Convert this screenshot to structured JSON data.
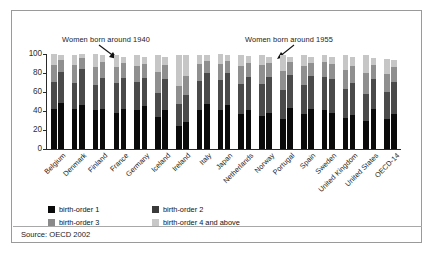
{
  "figure": {
    "source_note": "Source: OECD 2002",
    "annotations": [
      {
        "name": "cohort-1940",
        "text": "Women born around 1940"
      },
      {
        "name": "cohort-1955",
        "text": "Women born around 1955"
      }
    ]
  },
  "legend": {
    "position": "below-axis",
    "items": [
      {
        "key": "b1",
        "label": "birth-order 1",
        "color": "#0a0a0a"
      },
      {
        "key": "b2",
        "label": "birth-order 2",
        "color": "#3a3a3a"
      },
      {
        "key": "b3",
        "label": "birth-order 3",
        "color": "#8a8a8a"
      },
      {
        "key": "b4",
        "label": "birth-order 4 and above",
        "color": "#c8c8c8"
      }
    ]
  },
  "chart_data": {
    "type": "bar",
    "subtype": "stacked-grouped",
    "title": "",
    "xlabel": "",
    "ylabel": "",
    "ylim": [
      0,
      100
    ],
    "yticks": [
      0,
      20,
      40,
      60,
      80,
      100
    ],
    "ytick_labels": [
      "0",
      "20",
      "40",
      "60",
      "80",
      "100"
    ],
    "grid": false,
    "categories": [
      "Belgium",
      "Denmark",
      "Finland",
      "France",
      "Germany",
      "Iceland",
      "Ireland",
      "Italy",
      "Japan",
      "Netherlands",
      "Norway",
      "Portugal",
      "Spain",
      "Sweden",
      "United Kingdom",
      "United States",
      "OECD-14"
    ],
    "group_labels": [
      "Women born around 1940",
      "Women born around 1955"
    ],
    "stack_order": [
      "birth-order 1",
      "birth-order 2",
      "birth-order 3",
      "birth-order 4 and above"
    ],
    "series": [
      {
        "name": "birth-order 1",
        "cohort_1940": [
          42,
          42,
          41,
          38,
          41,
          34,
          24,
          41,
          41,
          37,
          35,
          32,
          37,
          41,
          33,
          29,
          32
        ],
        "cohort_1955": [
          48,
          46,
          42,
          42,
          45,
          41,
          28,
          47,
          46,
          41,
          38,
          43,
          42,
          38,
          36,
          42,
          37
        ]
      },
      {
        "name": "birth-order 2",
        "cohort_1940": [
          29,
          28,
          26,
          31,
          30,
          25,
          23,
          31,
          32,
          31,
          33,
          30,
          30,
          35,
          30,
          29,
          28
        ],
        "cohort_1955": [
          33,
          38,
          33,
          33,
          30,
          33,
          29,
          33,
          34,
          35,
          38,
          35,
          35,
          36,
          34,
          32,
          34
        ]
      },
      {
        "name": "birth-order 3",
        "cohort_1940": [
          17,
          18,
          19,
          17,
          16,
          22,
          19,
          17,
          17,
          19,
          20,
          20,
          20,
          16,
          20,
          22,
          19
        ],
        "cohort_1955": [
          13,
          12,
          17,
          16,
          14,
          14,
          20,
          13,
          13,
          15,
          15,
          14,
          14,
          16,
          17,
          14,
          15
        ]
      },
      {
        "name": "birth-order 4 and above",
        "cohort_1940": [
          12,
          11,
          14,
          13,
          12,
          18,
          33,
          10,
          10,
          12,
          11,
          17,
          12,
          7,
          16,
          19,
          16
        ],
        "cohort_1955": [
          5,
          4,
          7,
          6,
          8,
          9,
          22,
          6,
          6,
          7,
          6,
          5,
          6,
          7,
          10,
          8,
          8
        ]
      }
    ]
  }
}
